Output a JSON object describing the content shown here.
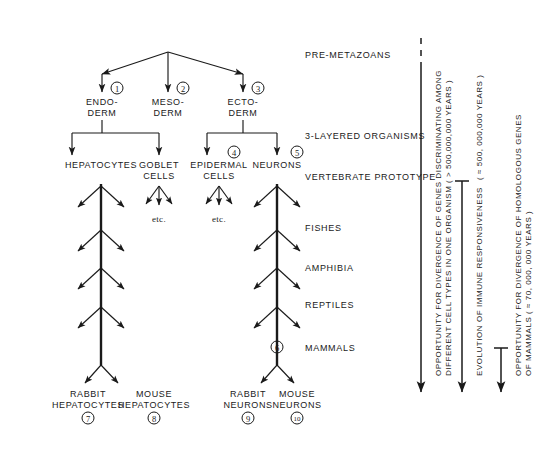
{
  "figure": {
    "ink_color": "#1a1a1a",
    "background": "#ffffff"
  },
  "germ_layers": [
    {
      "id": "endoderm",
      "label": "ENDO-\nDERM",
      "marker": "1",
      "x": 102
    },
    {
      "id": "mesoderm",
      "label": "MESO-\nDERM",
      "marker": "2",
      "x": 168
    },
    {
      "id": "ectoderm",
      "label": "ECTO-\nDERM",
      "marker": "3",
      "x": 243
    }
  ],
  "cell_types": [
    {
      "id": "hepatocytes",
      "label": "HEPATOCYTES",
      "marker": "",
      "x": 101,
      "etc": ""
    },
    {
      "id": "goblet-cells",
      "label": "GOBLET\nCELLS",
      "marker": "",
      "x": 159,
      "etc": "etc."
    },
    {
      "id": "epidermal-cells",
      "label": "EPIDERMAL\nCELLS",
      "marker": "4",
      "x": 219,
      "etc": "etc."
    },
    {
      "id": "neurons",
      "label": "NEURONS",
      "marker": "5",
      "x": 277,
      "etc": ""
    }
  ],
  "mammal_node_marker": "6",
  "terminal_cells": [
    {
      "id": "rabbit-hepatocytes",
      "label": "RABBIT\nHEPATOCYTES",
      "marker": "7",
      "x": 88
    },
    {
      "id": "mouse-hepatocytes",
      "label": "MOUSE\nHEPATOCYTES",
      "marker": "8",
      "x": 154
    },
    {
      "id": "rabbit-neurons",
      "label": "RABBIT\nNEURONS",
      "marker": "9",
      "x": 248
    },
    {
      "id": "mouse-neurons",
      "label": "MOUSE\nNEURONS",
      "marker": "10",
      "x": 297
    }
  ],
  "stages": [
    {
      "id": "pre-metazoans",
      "label": "PRE-METAZOANS",
      "y": 55
    },
    {
      "id": "three-layered-organisms",
      "label": "3-LAYERED ORGANISMS",
      "y": 136
    },
    {
      "id": "vertebrate-prototype",
      "label": "VERTEBRATE PROTOTYPE",
      "y": 177
    },
    {
      "id": "fishes",
      "label": "FISHES",
      "y": 228
    },
    {
      "id": "amphibia",
      "label": "AMPHIBIA",
      "y": 268
    },
    {
      "id": "reptiles",
      "label": "REPTILES",
      "y": 305
    },
    {
      "id": "mammals",
      "label": "MAMMALS",
      "y": 348
    }
  ],
  "timescale_arrows": [
    {
      "id": "gene-divergence-cell-types",
      "line1": "OPPORTUNITY FOR DIVERGENCE OF GENES DISCRIMINATING AMONG",
      "line2": "DIFFERENT CELL TYPES IN ONE ORGANISM ( > 500,000,000 YEARS )",
      "x": 421,
      "top": 38,
      "bottom": 400,
      "cap": "dashed"
    },
    {
      "id": "immune-responsiveness",
      "line1": "EVOLUTION OF IMMUNE RESPONSIVENESS",
      "line2": "( ≈ 500, 000,000 YEARS )",
      "x": 462,
      "top": 181,
      "bottom": 400,
      "cap": "bar"
    },
    {
      "id": "homologous-genes-mammals",
      "line1": "OPPORTUNITY FOR DIVERGENCE OF HOMOLOGOUS GENES",
      "line2": "OF MAMMALS ( ≈ 70, 000, 000 YEARS )",
      "x": 501,
      "top": 348,
      "bottom": 400,
      "cap": "bar"
    }
  ]
}
